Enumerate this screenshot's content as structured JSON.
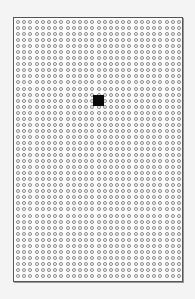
{
  "board": {
    "columns": 27,
    "rows": 43,
    "cell_shape": "circle",
    "cell_color": "#8a8a8a",
    "border_color": "#555555",
    "background": "#fbfbfb"
  },
  "marker": {
    "shape": "filled-square",
    "color": "#0a0a0a",
    "column": 13,
    "row": 13
  }
}
